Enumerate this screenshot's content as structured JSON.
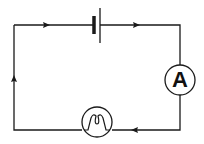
{
  "diagram": {
    "type": "electric-circuit",
    "components": [
      {
        "id": "battery",
        "kind": "cell",
        "position": "top"
      },
      {
        "id": "ammeter",
        "kind": "ammeter",
        "label": "A",
        "position": "right"
      },
      {
        "id": "lamp",
        "kind": "lamp",
        "position": "bottom"
      }
    ],
    "current_arrows": [
      {
        "position": "top-left",
        "direction": "right"
      },
      {
        "position": "top-right",
        "direction": "right"
      },
      {
        "position": "bottom-right",
        "direction": "left"
      },
      {
        "position": "left",
        "direction": "up"
      }
    ],
    "ammeter_label": "A",
    "colors": {
      "line": "#1a1a1a",
      "background": "#ffffff"
    }
  }
}
